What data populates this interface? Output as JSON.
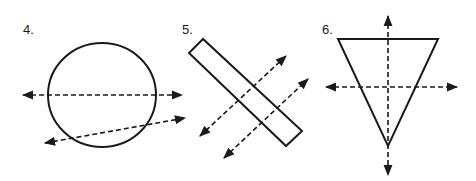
{
  "figures": [
    {
      "label": "4.",
      "shape": "circle",
      "description": "Circle with a dashed double-arrow line through its center and a second slanted dashed double-arrow line crossing the lower part",
      "label_pos": [
        23,
        22
      ],
      "circle": {
        "cx": 102,
        "cy": 95,
        "rx": 54,
        "ry": 52
      },
      "lines": [
        {
          "x1": 23,
          "y1": 95,
          "x2": 182,
          "y2": 95,
          "style": "dashed",
          "arrows": "both"
        },
        {
          "x1": 45,
          "y1": 143,
          "x2": 185,
          "y2": 118,
          "style": "dashed",
          "arrows": "both"
        }
      ]
    },
    {
      "label": "5.",
      "shape": "rectangle",
      "description": "Tilted long rectangle with two parallel dashed double-arrow lines crossing it perpendicularly",
      "label_pos": [
        182,
        22
      ],
      "polygon": [
        [
          203,
          39
        ],
        [
          189,
          53
        ],
        [
          286,
          146
        ],
        [
          302,
          131
        ]
      ],
      "lines": [
        {
          "x1": 200,
          "y1": 136,
          "x2": 286,
          "y2": 56,
          "style": "dashed",
          "arrows": "both"
        },
        {
          "x1": 224,
          "y1": 158,
          "x2": 308,
          "y2": 79,
          "style": "dashed",
          "arrows": "both"
        }
      ]
    },
    {
      "label": "6.",
      "shape": "triangle",
      "description": "Inverted isosceles triangle with a vertical dashed double-arrow axis and a horizontal dashed double-arrow line",
      "label_pos": [
        322,
        22
      ],
      "polygon": [
        [
          338,
          39
        ],
        [
          438,
          39
        ],
        [
          388,
          146
        ]
      ],
      "lines": [
        {
          "x1": 388,
          "y1": 16,
          "x2": 388,
          "y2": 175,
          "style": "dashed",
          "arrows": "both"
        },
        {
          "x1": 326,
          "y1": 87,
          "x2": 457,
          "y2": 87,
          "style": "dashed",
          "arrows": "both"
        }
      ]
    }
  ],
  "colors": {
    "stroke": "#1a1a1a",
    "background": "#ffffff"
  }
}
